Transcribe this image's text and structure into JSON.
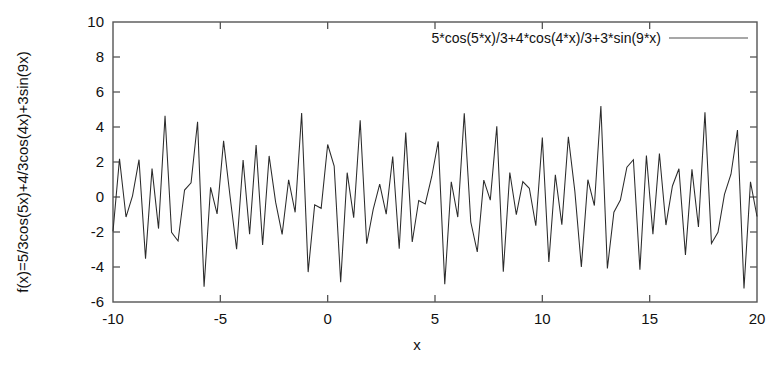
{
  "chart_data": {
    "type": "line",
    "title": "",
    "xlabel": "x",
    "ylabel": "f(x)=5/3cos(5x)+4/3cos(4x)+3sin(9x)",
    "xlim": [
      -10,
      20
    ],
    "ylim": [
      -6,
      10
    ],
    "xticks": [
      -10,
      -5,
      0,
      5,
      10,
      15,
      20
    ],
    "xtick_labels": [
      "-10",
      "-5",
      "0",
      "5",
      "10",
      "15",
      "20"
    ],
    "yticks": [
      -6,
      -4,
      -2,
      0,
      2,
      4,
      6,
      8,
      10
    ],
    "ytick_labels": [
      "-6",
      "-4",
      "-2",
      "0",
      "2",
      "4",
      "6",
      "8",
      "10"
    ],
    "grid": false,
    "legend_position": "top-right",
    "series": [
      {
        "name": "5*cos(5*x)/3+4*cos(4*x)/3+3*sin(9*x)",
        "expression": "5*cos(5*x)/3+4*cos(4*x)/3+3*sin(9*x)",
        "color": "#2b2b2b",
        "samples": 100,
        "x_start": -10,
        "x_end": 20,
        "y_observed_min": -5.1,
        "y_observed_max": 5.1
      }
    ]
  },
  "axes": {
    "x_axis_label": "x",
    "y_axis_label": "f(x)=5/3cos(5x)+4/3cos(4x)+3sin(9x)"
  },
  "legend": {
    "entry_label": "5*cos(5*x)/3+4*cos(4*x)/3+3*sin(9*x)",
    "sample_color": "#8a8a8a"
  }
}
